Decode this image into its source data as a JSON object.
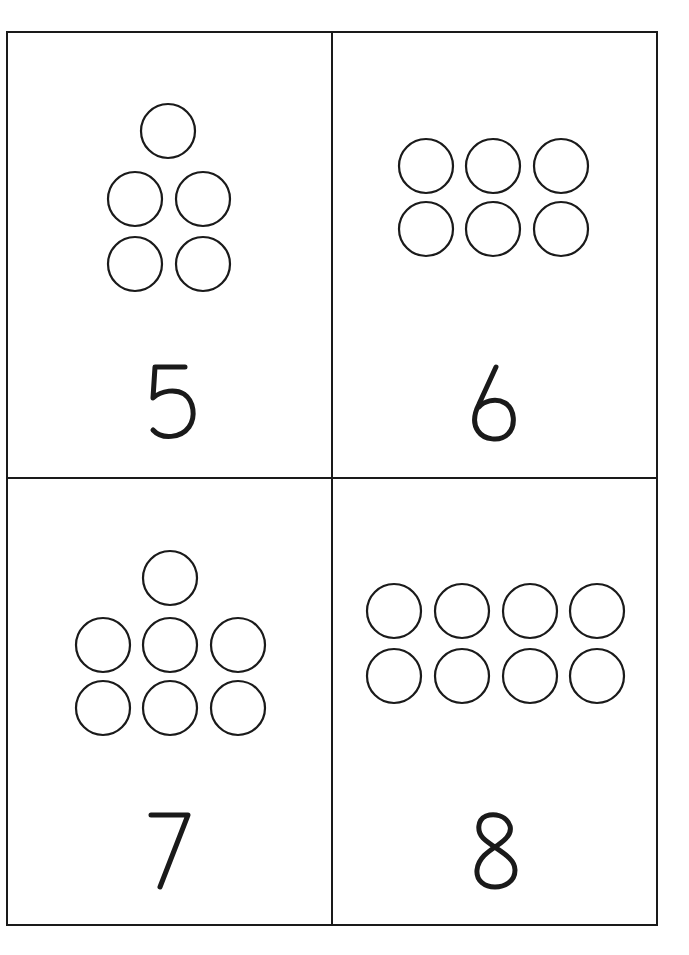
{
  "page": {
    "background": "#ffffff",
    "ink_color": "#1a1a1a",
    "border": {
      "x": 7,
      "y": 32,
      "width": 650,
      "height": 893,
      "divider_x": 332,
      "divider_y": 478
    }
  },
  "cards": [
    {
      "id": "card-5",
      "numeral": "5",
      "count": 5,
      "arrangement": "1-2-2 pyramid",
      "circle_radius": 27,
      "circles": [
        [
          168,
          131
        ],
        [
          135,
          199
        ],
        [
          203,
          199
        ],
        [
          135,
          264
        ],
        [
          203,
          264
        ]
      ],
      "numeral_pos": [
        172,
        402
      ]
    },
    {
      "id": "card-6",
      "numeral": "6",
      "count": 6,
      "arrangement": "2 rows of 3",
      "circle_radius": 27,
      "circles": [
        [
          426,
          166
        ],
        [
          493,
          166
        ],
        [
          561,
          166
        ],
        [
          426,
          229
        ],
        [
          493,
          229
        ],
        [
          561,
          229
        ]
      ],
      "numeral_pos": [
        493,
        402
      ]
    },
    {
      "id": "card-7",
      "numeral": "7",
      "count": 7,
      "arrangement": "1-3-3 pyramid",
      "circle_radius": 27,
      "circles": [
        [
          170,
          578
        ],
        [
          103,
          645
        ],
        [
          170,
          645
        ],
        [
          238,
          645
        ],
        [
          103,
          708
        ],
        [
          170,
          708
        ],
        [
          238,
          708
        ]
      ],
      "numeral_pos": [
        170,
        850
      ]
    },
    {
      "id": "card-8",
      "numeral": "8",
      "count": 8,
      "arrangement": "2 rows of 4",
      "circle_radius": 27,
      "circles": [
        [
          394,
          611
        ],
        [
          462,
          611
        ],
        [
          530,
          611
        ],
        [
          597,
          611
        ],
        [
          394,
          676
        ],
        [
          462,
          676
        ],
        [
          530,
          676
        ],
        [
          597,
          676
        ]
      ],
      "numeral_pos": [
        495,
        852
      ]
    }
  ]
}
